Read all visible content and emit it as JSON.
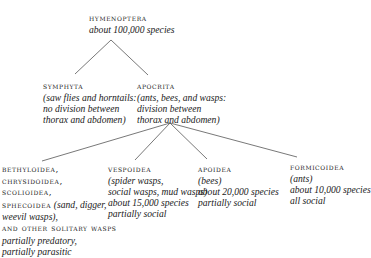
{
  "root": {
    "name": "HYMENOPTERA",
    "note": "about 100,000 species"
  },
  "level1": [
    {
      "name": "SYMPHYTA",
      "lines": [
        "(saw flies and horntails:",
        "no division between",
        "thorax and abdomen)"
      ]
    },
    {
      "name": "APOCRITA",
      "lines": [
        "(ants, bees, and wasps:",
        "division between",
        "thorax and abdomen)"
      ]
    }
  ],
  "level2": [
    {
      "names": [
        "BETHYLOIDEA,",
        "CHRYSIDOIDEA,",
        "SCOLIOIDEA,"
      ],
      "sphecoidea": "SPHECOIDEA",
      "sphecoidea_note": "(sand, digger,",
      "note_cont": "weevil wasps),",
      "others": "AND OTHER SOLITARY WASPS",
      "lines": [
        "partially predatory,",
        "partially parasitic"
      ]
    },
    {
      "name": "VESPOIDEA",
      "lines": [
        "(spider wasps,",
        "social wasps, mud wasps)",
        "about 15,000 species",
        "partially social"
      ]
    },
    {
      "name": "APOIDEA",
      "lines": [
        "(bees)",
        "about 20,000 species",
        "partially social"
      ]
    },
    {
      "name": "FORMICOIDEA",
      "lines": [
        "(ants)",
        "about 10,000 species",
        "all social"
      ]
    }
  ],
  "colors": {
    "text": "#1a1a1a",
    "line": "#555555",
    "background": "#ffffff"
  }
}
